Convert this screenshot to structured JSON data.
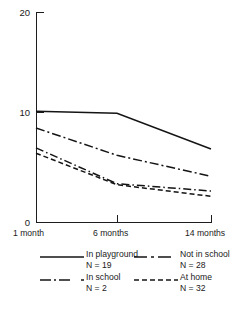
{
  "chart_data": {
    "type": "line",
    "title": "",
    "xlabel": "",
    "ylabel": "",
    "x": [
      "1 month",
      "6 months",
      "14 months"
    ],
    "categories": [
      "1 month",
      "6 months",
      "14 months"
    ],
    "ylim": [
      0,
      20
    ],
    "yticks": [
      0,
      10,
      20
    ],
    "ytick_labels": [
      "0",
      "10",
      "20"
    ],
    "grid": false,
    "legend_position": "below-axes",
    "series": [
      {
        "name": "In playground",
        "n_label": "N = 19",
        "n": 19,
        "style": "solid",
        "values": [
          10.6,
          10.4,
          7.0
        ]
      },
      {
        "name": "Not in school",
        "n_label": "N = 28",
        "n": 28,
        "style": "dash-dot-dash",
        "values": [
          9.0,
          6.4,
          4.4
        ]
      },
      {
        "name": "In school",
        "n_label": "N = 2",
        "n": 2,
        "style": "long-dash-dot",
        "values": [
          7.1,
          3.7,
          3.0
        ]
      },
      {
        "name": "At home",
        "n_label": "N = 32",
        "n": 32,
        "style": "dashed",
        "values": [
          6.6,
          3.6,
          2.5
        ]
      }
    ]
  },
  "axis": {
    "y_tick_top": "20",
    "y_tick_mid": "10",
    "y_tick_zero": "0",
    "x_tick_1": "1 month",
    "x_tick_2": "6 months",
    "x_tick_3": "14 months"
  },
  "legend": {
    "entries": [
      {
        "label": "In playground",
        "n_label": "N = 19"
      },
      {
        "label": "In school",
        "n_label": "N = 2"
      },
      {
        "label": "Not in school",
        "n_label": "N = 28"
      },
      {
        "label": "At home",
        "n_label": "N = 32"
      }
    ]
  },
  "colors": {
    "ink": "#141414",
    "background": "#ffffff"
  }
}
